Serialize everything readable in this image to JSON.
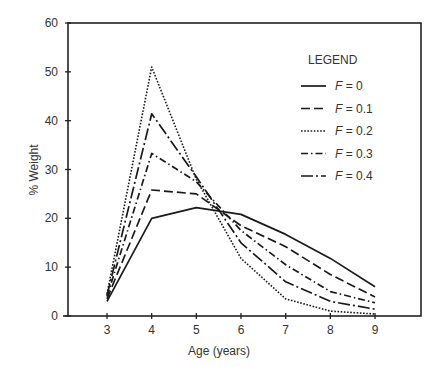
{
  "chart_data": {
    "type": "line",
    "title": "",
    "xlabel": "Age (years)",
    "ylabel": "% Weight",
    "xlim": [
      2,
      10
    ],
    "ylim": [
      0,
      60
    ],
    "x": [
      3,
      4,
      5,
      6,
      7,
      8,
      9
    ],
    "x_ticks": [
      "3",
      "4",
      "5",
      "6",
      "7",
      "8",
      "9"
    ],
    "y_ticks": [
      "0",
      "10",
      "20",
      "30",
      "40",
      "50",
      "60"
    ],
    "grid": false,
    "legend_title": "LEGEND",
    "legend_position": "upper right (inside)",
    "series": [
      {
        "name": "F = 0",
        "label_var": "F",
        "label_val": "= 0",
        "style": "solid",
        "values": [
          3.0,
          20.0,
          22.2,
          20.8,
          16.7,
          11.8,
          6.0
        ]
      },
      {
        "name": "F = 0.1",
        "label_var": "F",
        "label_val": "= 0.1",
        "style": "dashed",
        "values": [
          3.5,
          25.8,
          25.0,
          18.5,
          14.2,
          8.5,
          3.9
        ]
      },
      {
        "name": "F = 0.2",
        "label_var": "F",
        "label_val": "= 0.2",
        "style": "dotted",
        "values": [
          4.5,
          51.0,
          28.0,
          11.8,
          3.5,
          1.0,
          0.4
        ]
      },
      {
        "name": "F = 0.3",
        "label_var": "F",
        "label_val": "= 0.3",
        "style": "dash-dot",
        "values": [
          4.0,
          33.3,
          27.5,
          17.5,
          10.5,
          5.0,
          2.7
        ]
      },
      {
        "name": "F = 0.4",
        "label_var": "F",
        "label_val": "= 0.4",
        "style": "long-dash",
        "values": [
          4.2,
          41.4,
          28.5,
          15.0,
          7.0,
          3.0,
          1.4
        ]
      }
    ]
  }
}
